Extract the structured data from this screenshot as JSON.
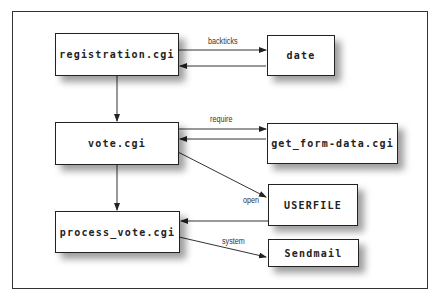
{
  "diagram": {
    "nodes": [
      {
        "id": "registration",
        "label": "registration.cgi"
      },
      {
        "id": "date",
        "label": "date"
      },
      {
        "id": "vote",
        "label": "vote.cgi"
      },
      {
        "id": "get_form_data",
        "label": "get_form-data.cgi"
      },
      {
        "id": "userfile",
        "label": "USERFILE"
      },
      {
        "id": "process_vote",
        "label": "process_vote.cgi"
      },
      {
        "id": "sendmail",
        "label": "Sendmail"
      }
    ],
    "edges": [
      {
        "from": "registration.cgi",
        "to": "date",
        "label": "backticks"
      },
      {
        "from": "date",
        "to": "registration.cgi",
        "label": ""
      },
      {
        "from": "registration.cgi",
        "to": "vote.cgi",
        "label": ""
      },
      {
        "from": "vote.cgi",
        "to": "get_form-data.cgi",
        "label": "require"
      },
      {
        "from": "get_form-data.cgi",
        "to": "vote.cgi",
        "label": ""
      },
      {
        "from": "vote.cgi",
        "to": "USERFILE",
        "label": "open"
      },
      {
        "from": "vote.cgi",
        "to": "process_vote.cgi",
        "label": ""
      },
      {
        "from": "USERFILE",
        "to": "process_vote.cgi",
        "label": ""
      },
      {
        "from": "process_vote.cgi",
        "to": "Sendmail",
        "label": "system"
      }
    ],
    "edge_labels": {
      "backticks": "backticks",
      "require": "require",
      "open": "open",
      "system": "system"
    }
  }
}
